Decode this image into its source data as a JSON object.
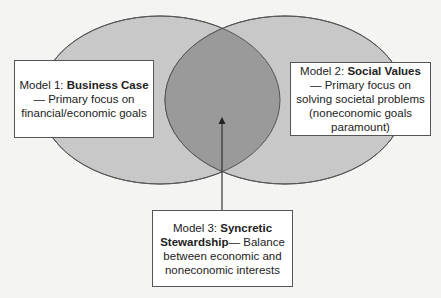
{
  "diagram": {
    "type": "venn",
    "colors": {
      "background": "#f4f4f2",
      "circle_fill": "#c8c8c8",
      "overlap_fill": "#9a9a9a",
      "stroke": "#555555"
    },
    "models": [
      {
        "prefix": "Model 1: ",
        "name": "Business Case",
        "suffix": "—",
        "description": "Primary focus on financial/economic goals"
      },
      {
        "prefix": "Model 2: ",
        "name": "Social Values",
        "suffix": "—",
        "description": "Primary focus on solving societal problems (noneconomic goals paramount)"
      },
      {
        "prefix": "Model 3: ",
        "name": "Syncretic Stewardship",
        "suffix": "— ",
        "description": "Balance between economic and noneconomic interests"
      }
    ]
  }
}
